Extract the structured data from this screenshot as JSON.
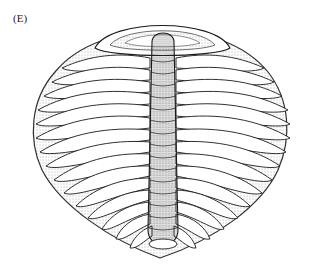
{
  "figure": {
    "panel_label": "(E)",
    "colors": {
      "ink": "#1a1a1a",
      "paper": "#ffffff",
      "stipple": "#555555"
    },
    "segments_per_side": 17
  }
}
